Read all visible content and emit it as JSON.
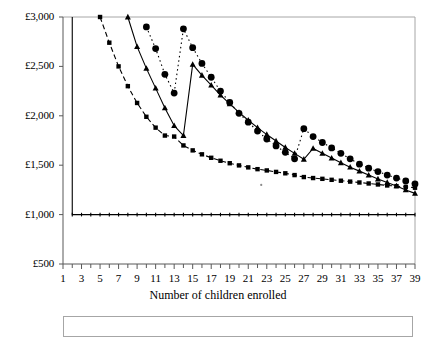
{
  "chart_data": {
    "type": "line",
    "title": "",
    "xlabel": "Number of children enrolled",
    "ylabel": "",
    "xlim": [
      1,
      39
    ],
    "ylim": [
      500,
      3000
    ],
    "ytick_labels": [
      "£3,000",
      "£2,500",
      "£2,000",
      "£1,500",
      "£1,000",
      "£500"
    ],
    "ytick_values": [
      3000,
      2500,
      2000,
      1500,
      1000,
      500
    ],
    "xtick_labels": [
      "1",
      "3",
      "5",
      "7",
      "9",
      "11",
      "13",
      "15",
      "17",
      "19",
      "21",
      "23",
      "25",
      "27",
      "29",
      "31",
      "33",
      "35",
      "37",
      "39"
    ],
    "xtick_values": [
      1,
      3,
      5,
      7,
      9,
      11,
      13,
      15,
      17,
      19,
      21,
      23,
      25,
      27,
      29,
      31,
      33,
      35,
      37,
      39
    ],
    "minor_xticks": [
      1,
      2,
      3,
      4,
      5,
      6,
      7,
      8,
      9,
      10,
      11,
      12,
      13,
      14,
      15,
      16,
      17,
      18,
      19,
      20,
      21,
      22,
      23,
      24,
      25,
      26,
      27,
      28,
      29,
      30,
      31,
      32,
      33,
      34,
      35,
      36,
      37,
      38,
      39
    ],
    "grid": false,
    "legend_position": "bottom",
    "legend_entries": [],
    "currency_symbol": "£",
    "series": [
      {
        "name": "series-squares",
        "marker": "square",
        "linestyle": "dashed",
        "color": "#000000",
        "x": [
          5,
          6,
          7,
          8,
          9,
          10,
          11,
          12,
          13,
          14,
          15,
          16,
          17,
          18,
          19,
          20,
          21,
          22,
          23,
          24,
          25,
          26,
          27,
          28,
          29,
          30,
          31,
          32,
          33,
          34,
          35,
          36,
          37,
          38,
          39
        ],
        "y": [
          3000,
          2740,
          2500,
          2300,
          2130,
          1990,
          1880,
          1800,
          1790,
          1700,
          1650,
          1610,
          1575,
          1545,
          1520,
          1498,
          1478,
          1460,
          1447,
          1432,
          1418,
          1400,
          1380,
          1370,
          1362,
          1352,
          1343,
          1334,
          1325,
          1315,
          1305,
          1295,
          1288,
          1280,
          1272
        ]
      },
      {
        "name": "series-triangles",
        "marker": "triangle",
        "linestyle": "solid",
        "color": "#000000",
        "x": [
          8,
          9,
          10,
          11,
          12,
          13,
          14,
          15,
          16,
          17,
          18,
          19,
          20,
          21,
          22,
          23,
          24,
          25,
          26,
          27,
          28,
          29,
          30,
          31,
          32,
          33,
          34,
          35,
          36,
          37,
          38,
          39
        ],
        "y": [
          3000,
          2700,
          2480,
          2280,
          2080,
          1900,
          1800,
          2520,
          2410,
          2310,
          2210,
          2120,
          2035,
          1955,
          1880,
          1810,
          1745,
          1680,
          1620,
          1560,
          1670,
          1620,
          1572,
          1525,
          1480,
          1440,
          1400,
          1360,
          1325,
          1290,
          1250,
          1215
        ]
      },
      {
        "name": "series-circles",
        "marker": "circle",
        "linestyle": "dotted",
        "color": "#000000",
        "x": [
          10,
          11,
          12,
          13,
          14,
          15,
          16,
          17,
          18,
          19,
          20,
          21,
          22,
          23,
          24,
          25,
          26,
          27,
          28,
          29,
          30,
          31,
          32,
          33,
          34,
          35,
          36,
          37,
          38,
          39
        ],
        "y": [
          2900,
          2680,
          2420,
          2230,
          2880,
          2690,
          2530,
          2390,
          2250,
          2135,
          2025,
          1935,
          1845,
          1765,
          1695,
          1630,
          1565,
          1870,
          1790,
          1730,
          1675,
          1620,
          1565,
          1510,
          1470,
          1435,
          1400,
          1370,
          1340,
          1310
        ]
      },
      {
        "name": "series-flat-baseline",
        "marker": "tick",
        "linestyle": "solid",
        "color": "#000000",
        "x": [
          2,
          3,
          4,
          5,
          6,
          7,
          8,
          9,
          10,
          11,
          12,
          13,
          14,
          15,
          16,
          17,
          18,
          19,
          20,
          21,
          22,
          23,
          24,
          25,
          26,
          27,
          28,
          29,
          30,
          31,
          32,
          33,
          34,
          35,
          36,
          37,
          38,
          39
        ],
        "y": [
          1000,
          1000,
          1000,
          1000,
          1000,
          1000,
          1000,
          1000,
          1000,
          1000,
          1000,
          1000,
          1000,
          1000,
          1000,
          1000,
          1000,
          1000,
          1000,
          1000,
          1000,
          1000,
          1000,
          1000,
          1000,
          1000,
          1000,
          1000,
          1000,
          1000,
          1000,
          1000,
          1000,
          1000,
          1000,
          1000,
          1000,
          1000
        ],
        "note": "vertical drop from 3000 to 1000 at x=2"
      }
    ],
    "annotations": [
      {
        "name": "stray-dot",
        "x": 22.4,
        "y": 1300
      }
    ]
  },
  "axis": {
    "x_title": "Number of children enrolled"
  },
  "legend": {
    "box_visible": true,
    "items": []
  }
}
